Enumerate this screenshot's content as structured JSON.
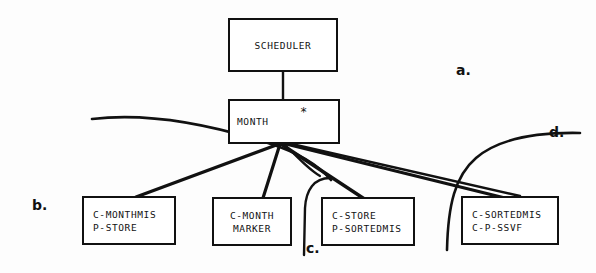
{
  "diagram": {
    "ink_color": "#111111",
    "background": "#fdfdfd",
    "nodes": {
      "scheduler": {
        "line1": "SCHEDULER",
        "line2": ""
      },
      "month": {
        "line1": "MONTH",
        "line2": "",
        "annotation": "*"
      },
      "monthmis": {
        "line1": "C-MONTHMIS",
        "line2": "P-STORE"
      },
      "monthmarker": {
        "line1": "C-MONTH",
        "line2": "MARKER"
      },
      "store": {
        "line1": "C-STORE",
        "line2": "P-SORTEDMIS"
      },
      "sortedmis": {
        "line1": "C-SORTEDMIS",
        "line2": "C-P-SSVF"
      }
    },
    "callouts": {
      "a": "a.",
      "b": "b.",
      "c": "c.",
      "d": "d."
    }
  }
}
